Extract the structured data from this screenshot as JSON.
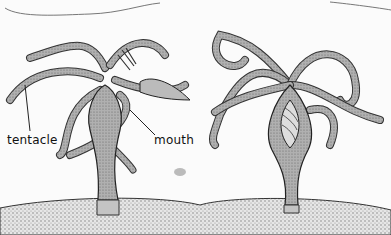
{
  "figure": {
    "labels": {
      "tentacle": "tentacle",
      "mouth": "mouth"
    },
    "panels": [
      {
        "name": "hydra-feeding",
        "description": "hydra capturing prey with tentacles"
      },
      {
        "name": "hydra-digesting",
        "description": "hydra with prey inside body"
      }
    ],
    "colors": {
      "outline": "#2a2a2a",
      "body_fill": "#9a9a9a",
      "tentacle_fill": "#a8a8a8",
      "substrate_fill": "#d8d8d8"
    }
  }
}
